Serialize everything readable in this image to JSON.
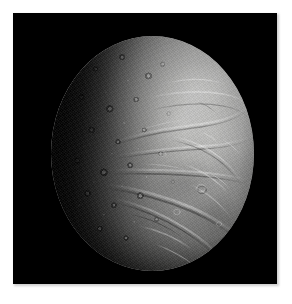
{
  "page": {
    "background_color": "#ffffff",
    "width": 292,
    "height": 304
  },
  "photo": {
    "name": "enceladus-photograph",
    "background_color": "#000000",
    "frame": {
      "left": 13,
      "top": 13,
      "width": 264,
      "height": 271
    },
    "shadow_color": "#cfcfcf",
    "subject": "Enceladus",
    "caption": "",
    "alt_text": "Grayscale spacecraft photograph of Saturn's icy moon Enceladus, lit from the right. The right half shows bright smooth grooved plains crossed by curving fractures and ridges; the left half is heavily cratered and fades into the dark terminator shadow against a black sky."
  },
  "moon": {
    "name": "moon-disk",
    "disk": {
      "left": 38,
      "top": 23,
      "width": 203,
      "height": 235
    },
    "illumination": "right-limb lit, left terminator in shadow",
    "colors": {
      "highlight": "#c8c8c6",
      "midtone": "#9a9a99",
      "shadow_edge": "#2a2a29",
      "space": "#000000"
    },
    "terrain_regions": [
      {
        "name": "cratered-terrain",
        "label": "Heavily cratered terrain",
        "position": "left / terminator half"
      },
      {
        "name": "grooved-plains",
        "label": "Smooth grooved plains",
        "position": "right / sunlit half"
      },
      {
        "name": "fracture-ridges",
        "label": "Curvilinear fracture ridges",
        "position": "center to lower-right"
      },
      {
        "name": "bright-limb",
        "label": "Bright sunlit limb",
        "position": "upper-right"
      }
    ]
  }
}
